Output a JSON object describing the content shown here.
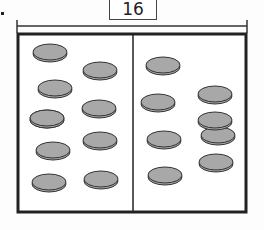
{
  "diagram": {
    "total_label": "16",
    "left_group": {
      "count": 10
    },
    "right_group": {
      "count": 8
    },
    "colors": {
      "counter_fill": "#a8a8a8",
      "counter_edge": "#333333",
      "frame": "#222222"
    },
    "counters_left": [
      [
        50,
        52
      ],
      [
        101,
        70
      ],
      [
        55,
        87
      ],
      [
        99,
        108
      ],
      [
        47,
        117
      ],
      [
        100,
        141
      ],
      [
        52,
        151
      ],
      [
        101,
        178
      ],
      [
        50,
        183
      ]
    ],
    "counters_right": [
      [
        163,
        65
      ],
      [
        215,
        94
      ],
      [
        158,
        102
      ],
      [
        218,
        136
      ],
      [
        164,
        139
      ],
      [
        165,
        176
      ],
      [
        215,
        162
      ],
      [
        216,
        43
      ]
    ]
  }
}
